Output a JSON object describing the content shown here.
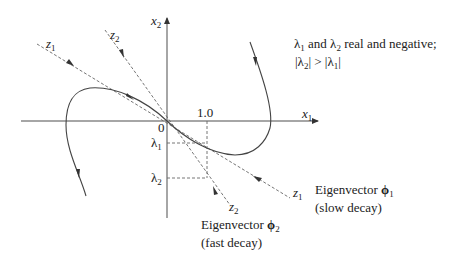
{
  "diagram": {
    "type": "phase-portrait",
    "axes": {
      "x_label": "x",
      "x_sub": "1",
      "y_label": "x",
      "y_sub": "2",
      "origin_label": "0",
      "x_tick_label": "1.0"
    },
    "eigen_axes": {
      "z1_upper": {
        "label": "z",
        "sub": "1"
      },
      "z1_lower": {
        "label": "z",
        "sub": "1"
      },
      "z2_upper": {
        "label": "z",
        "sub": "2"
      },
      "z2_lower": {
        "label": "z",
        "sub": "2"
      }
    },
    "y_ticks": [
      {
        "label": "λ",
        "sub": "1"
      },
      {
        "label": "λ",
        "sub": "2"
      }
    ],
    "annotation": {
      "line1_a": "λ",
      "line1_a_sub": "1",
      "line1_b": " and ",
      "line1_c": "λ",
      "line1_c_sub": "2",
      "line1_d": " real and negative;",
      "line2_a": "|λ",
      "line2_a_sub": "2",
      "line2_b": "| > |λ",
      "line2_b_sub": "1",
      "line2_c": "|"
    },
    "eigenvector1": {
      "title": "Eigenvector ",
      "symbol": "ϕ",
      "sub": "1",
      "note": "(slow decay)"
    },
    "eigenvector2": {
      "title": "Eigenvector ",
      "symbol": "ϕ",
      "sub": "2",
      "note": "(fast decay)"
    },
    "colors": {
      "axis": "#888888",
      "curve": "#444444",
      "dashed": "#666666",
      "text": "#222222"
    }
  }
}
